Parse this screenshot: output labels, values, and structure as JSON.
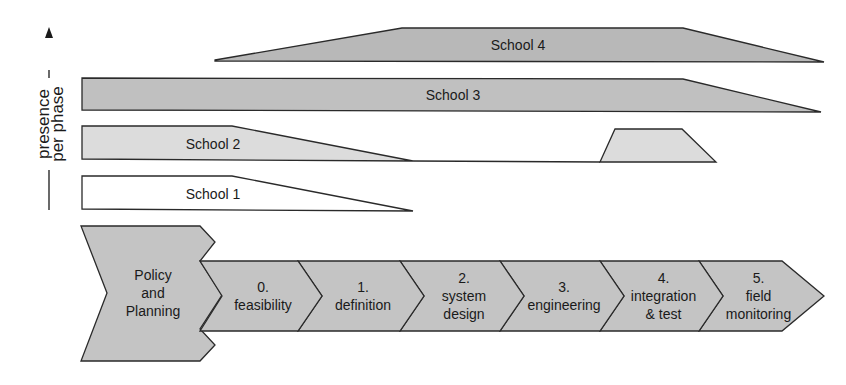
{
  "axis": {
    "label_line1": "presence",
    "label_line2": "per phase"
  },
  "colors": {
    "dark_fill": "#b8b8b8",
    "light_fill": "#dcdcdc",
    "white_fill": "#ffffff",
    "phase_fill": "#c4c4c4",
    "stroke": "#2a2a2a"
  },
  "schools": [
    {
      "label": "School 4"
    },
    {
      "label": "School 3"
    },
    {
      "label": "School 2"
    },
    {
      "label": "School 1"
    }
  ],
  "policy": {
    "line1": "Policy",
    "line2": "and",
    "line3": "Planning"
  },
  "phases": [
    {
      "num": "0.",
      "lines": [
        "feasibility"
      ]
    },
    {
      "num": "1.",
      "lines": [
        "definition"
      ]
    },
    {
      "num": "2.",
      "lines": [
        "system",
        "design"
      ]
    },
    {
      "num": "3.",
      "lines": [
        "engineering"
      ]
    },
    {
      "num": "4.",
      "lines": [
        "integration",
        "& test"
      ]
    },
    {
      "num": "5.",
      "lines": [
        "field",
        "monitoring"
      ]
    }
  ]
}
